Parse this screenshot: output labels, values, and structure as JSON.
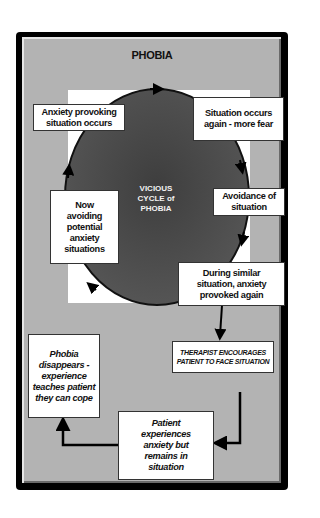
{
  "diagram": {
    "title": "PHOBIA",
    "center_label": [
      "VICIOUS",
      "CYCLE of",
      "PHOBIA"
    ],
    "cycle_nodes": [
      {
        "id": "anxiety-provoking",
        "text": "Anxiety provoking situation occurs"
      },
      {
        "id": "situation-again",
        "text": "Situation occurs again - more fear"
      },
      {
        "id": "avoidance",
        "text": "Avoidance of situation"
      },
      {
        "id": "during-similar",
        "text": "During similar situation, anxiety provoked again"
      },
      {
        "id": "now-avoiding",
        "text": "Now avoiding potential anxiety situations"
      }
    ],
    "therapy_nodes": [
      {
        "id": "therapist",
        "text": "THERAPIST ENCOURAGES PATIENT TO FACE SITUATION"
      },
      {
        "id": "patient-experiences",
        "text": "Patient experiences anxiety but remains in situation"
      },
      {
        "id": "phobia-disappears",
        "text": "Phobia disappears - experience teaches patient they can cope"
      }
    ],
    "edges": [
      {
        "from": "anxiety-provoking",
        "to": "situation-again",
        "style": "curved-arrow"
      },
      {
        "from": "situation-again",
        "to": "avoidance",
        "style": "curved-arrow"
      },
      {
        "from": "avoidance",
        "to": "during-similar",
        "style": "curved-arrow"
      },
      {
        "from": "during-similar",
        "to": "now-avoiding",
        "style": "curved-arrow"
      },
      {
        "from": "now-avoiding",
        "to": "anxiety-provoking",
        "style": "curved-arrow"
      },
      {
        "from": "during-similar",
        "to": "therapist",
        "style": "arrow"
      },
      {
        "from": "therapist",
        "to": "patient-experiences",
        "style": "elbow-arrow"
      },
      {
        "from": "patient-experiences",
        "to": "phobia-disappears",
        "style": "elbow-arrow"
      }
    ],
    "colors": {
      "frame": "#000000",
      "panel": "#b3b3b3",
      "circle": "#4a4a4a",
      "box": "#ffffff",
      "center_text": "#f2f2f2"
    }
  }
}
